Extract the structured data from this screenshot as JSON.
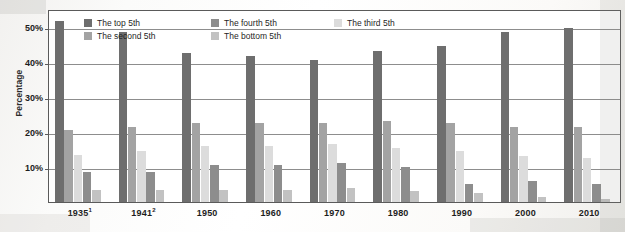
{
  "chart_data": {
    "type": "bar",
    "title": "",
    "subtitle": "",
    "xlabel": "",
    "ylabel": "Percentage",
    "ylim": [
      0,
      55
    ],
    "grid": true,
    "legend_position": "top-inside",
    "categories": [
      "1935¹",
      "1941²",
      "1950",
      "1960",
      "1970",
      "1980",
      "1990",
      "2000",
      "2010"
    ],
    "category_plain": [
      "1935",
      "1941",
      "1950",
      "1960",
      "1970",
      "1980",
      "1990",
      "2000",
      "2010"
    ],
    "category_footnotes": [
      "1",
      "2",
      "",
      "",
      "",
      "",
      "",
      "",
      ""
    ],
    "ytick_labels": [
      "10%",
      "20%",
      "30%",
      "40%",
      "50%"
    ],
    "ytick_values": [
      10,
      20,
      30,
      40,
      50
    ],
    "series": [
      {
        "name": "The top 5th",
        "color": "#6e6e6e",
        "values": [
          51.5,
          48.5,
          42.5,
          41.5,
          40.5,
          43.0,
          44.5,
          48.5,
          49.5
        ]
      },
      {
        "name": "The second 5th",
        "color": "#a3a3a3",
        "values": [
          20.5,
          21.5,
          22.5,
          22.5,
          22.5,
          23.0,
          22.5,
          21.5,
          21.5
        ]
      },
      {
        "name": "The third 5th",
        "color": "#dcdcdc",
        "values": [
          13.5,
          14.5,
          16.0,
          16.0,
          16.5,
          15.5,
          14.5,
          13.0,
          12.5
        ]
      },
      {
        "name": "The fourth 5th",
        "color": "#8d8d8d",
        "values": [
          8.5,
          8.5,
          10.5,
          10.5,
          11.0,
          10.0,
          5.0,
          6.0,
          5.0
        ]
      },
      {
        "name": "The bottom 5th",
        "color": "#c2c2c2",
        "values": [
          3.5,
          3.5,
          3.5,
          3.5,
          4.0,
          3.0,
          2.5,
          1.5,
          1.0
        ]
      }
    ]
  },
  "legend": {
    "items": [
      {
        "label": "The top 5th",
        "swatch": "#6e6e6e"
      },
      {
        "label": "The second 5th",
        "swatch": "#a3a3a3"
      },
      {
        "label": "The fourth 5th",
        "swatch": "#8d8d8d"
      },
      {
        "label": "The bottom 5th",
        "swatch": "#c2c2c2"
      },
      {
        "label": "The third 5th",
        "swatch": "#dcdcdc"
      }
    ]
  },
  "axis": {
    "y_title": "Percentage"
  },
  "colors": {
    "frame": "#5a5a5a",
    "gridline": "#8d8d8d",
    "text": "#1d1d1d",
    "plot_background": "#ffffff"
  }
}
